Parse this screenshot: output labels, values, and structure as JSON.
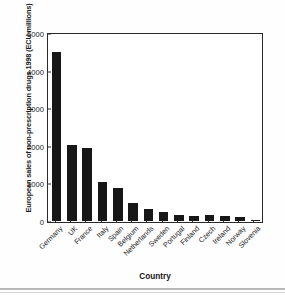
{
  "figure": {
    "background_color": "#ffffff",
    "bar_color": "#171717",
    "axis_color": "#2a2a2a"
  },
  "chart_data": {
    "type": "bar",
    "title": "",
    "subtitle": "",
    "xlabel": "Country",
    "ylabel": "European sales of non-prescription drugs 1998 (ECU millions)",
    "categories": [
      "Germany",
      "UK",
      "France",
      "Italy",
      "Spain",
      "Belgium",
      "Netherlands",
      "Sweden",
      "Portugal",
      "Finland",
      "Czech",
      "Ireland",
      "Norway",
      "Slovenia"
    ],
    "values": [
      4500,
      2020,
      1940,
      1040,
      890,
      470,
      330,
      230,
      170,
      145,
      170,
      135,
      105,
      35
    ],
    "ylim": [
      0,
      5000
    ],
    "yticks": [
      0,
      1000,
      2000,
      3000,
      4000,
      5000
    ],
    "ytick_labels": [
      "0",
      "1000",
      "2000",
      "3000",
      "4000",
      "5000"
    ],
    "grid": false,
    "legend": null,
    "legend_position": "none",
    "annotations": []
  }
}
